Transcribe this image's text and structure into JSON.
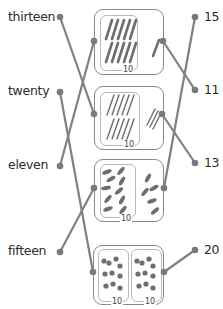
{
  "left_words": [
    {
      "label": "thirteen",
      "x": 8,
      "y": 10,
      "dot": [
        60,
        17
      ]
    },
    {
      "label": "twenty",
      "x": 8,
      "y": 84,
      "dot": [
        60,
        92
      ]
    },
    {
      "label": "eleven",
      "x": 8,
      "y": 158,
      "dot": [
        60,
        166
      ]
    },
    {
      "label": "fifteen",
      "x": 8,
      "y": 244,
      "dot": [
        60,
        252
      ]
    }
  ],
  "right_numbers": [
    {
      "label": "15",
      "x": 204,
      "y": 10,
      "dot": [
        195,
        17
      ]
    },
    {
      "label": "11",
      "x": 204,
      "y": 83,
      "dot": [
        195,
        90
      ]
    },
    {
      "label": "13",
      "x": 204,
      "y": 156,
      "dot": [
        195,
        163
      ]
    },
    {
      "label": "20",
      "x": 204,
      "y": 243,
      "dot": [
        195,
        250
      ]
    }
  ],
  "boxes": [
    {
      "name": "box-pencils-11",
      "content": "pencils",
      "ten_label": "10",
      "extra": 1
    },
    {
      "name": "box-straws-13",
      "content": "straws",
      "ten_label": "10",
      "extra": 3
    },
    {
      "name": "box-carrots-15",
      "content": "carrots",
      "ten_label": "10",
      "extra": 5
    },
    {
      "name": "box-cherries-20",
      "content": "cherries",
      "ten_labels": [
        "10",
        "10"
      ]
    }
  ],
  "lines": [
    {
      "from": "thirteen",
      "to": "box-straws-13",
      "points": [
        60,
        17,
        94,
        114
      ]
    },
    {
      "from": "twenty",
      "to": "box-cherries-20",
      "points": [
        60,
        92,
        93,
        272
      ]
    },
    {
      "from": "eleven",
      "to": "box-pencils-11",
      "points": [
        60,
        166,
        94,
        41
      ]
    },
    {
      "from": "fifteen",
      "to": "box-carrots-15",
      "points": [
        60,
        252,
        94,
        188
      ]
    },
    {
      "from": "15",
      "to": "box-carrots-15",
      "points": [
        195,
        17,
        164,
        188
      ]
    },
    {
      "from": "11",
      "to": "box-pencils-11",
      "points": [
        195,
        90,
        163,
        41
      ]
    },
    {
      "from": "13",
      "to": "box-straws-13",
      "points": [
        195,
        163,
        162,
        114
      ]
    },
    {
      "from": "20",
      "to": "box-cherries-20",
      "points": [
        195,
        250,
        164,
        272
      ]
    }
  ],
  "colors": {
    "line": "#808080",
    "dot": "#7a7a7a",
    "item": "#6e6e6e",
    "text": "#2a2a2a"
  }
}
